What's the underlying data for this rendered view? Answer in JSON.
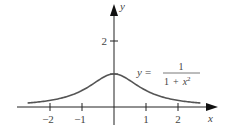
{
  "chart_data": {
    "type": "line",
    "title": "",
    "xlabel": "x",
    "ylabel": "y",
    "xlim": [
      -2.9,
      2.9
    ],
    "ylim": [
      0,
      2.9
    ],
    "x_ticks": [
      -2,
      -1,
      1,
      2
    ],
    "x_tick_labels": [
      "−2",
      "−1",
      "1",
      "2"
    ],
    "y_ticks": [
      2
    ],
    "y_tick_labels": [
      "2"
    ],
    "grid": false,
    "annotation": {
      "lhs": "y =",
      "numerator": "1",
      "denominator": "1 + x",
      "exponent": "2"
    },
    "series": [
      {
        "name": "y = 1/(1+x^2)",
        "x": [
          -2.7,
          -2.5,
          -2,
          -1.5,
          -1,
          -0.5,
          0,
          0.5,
          1,
          1.5,
          2,
          2.5,
          2.7
        ],
        "values": [
          0.121,
          0.138,
          0.2,
          0.308,
          0.5,
          0.8,
          1.0,
          0.8,
          0.5,
          0.308,
          0.2,
          0.138,
          0.121
        ]
      }
    ],
    "colors": {
      "axes": "#222222",
      "curve": "#555555",
      "text": "#444444"
    }
  }
}
